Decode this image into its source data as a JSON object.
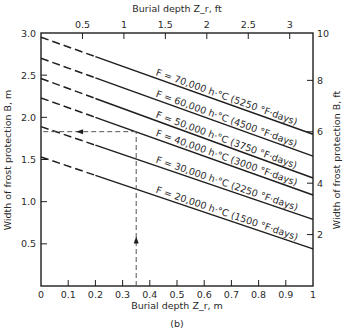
{
  "chart_data": {
    "type": "line",
    "caption": "(b)",
    "xlabel": "Burial depth Z_r, m",
    "x2label": "Burial depth Z_r, ft",
    "ylabel": "Width of frost protection B, m",
    "y2label": "Width of frost protection B, ft",
    "xlim": [
      0,
      1
    ],
    "ylim": [
      0,
      3.0
    ],
    "grid": false,
    "x_ticks": [
      "0",
      "0.1",
      "0.2",
      "0.3",
      "0.4",
      "0.5",
      "0.6",
      "0.7",
      "0.8",
      "0.9",
      "1"
    ],
    "x2_ticks": [
      "0.5",
      "1",
      "1.5",
      "2",
      "2.5",
      "3"
    ],
    "y_ticks": [
      "0.5",
      "1.0",
      "1.5",
      "2.0",
      "2.5",
      "3.0"
    ],
    "y2_ticks": [
      "2",
      "4",
      "6",
      "8",
      "10"
    ],
    "dashed_until_x": 0.2,
    "series": [
      {
        "name": "F = 70,000 h·°C (5250 °F·days)",
        "label_main": "F = 70,000 h·°C",
        "label_alt": "(5250 °F·days)",
        "x": [
          0,
          1
        ],
        "values": [
          2.95,
          1.8
        ]
      },
      {
        "name": "F = 60,000 h·°C (4500 °F·days)",
        "label_main": "F = 60,000 h·°C",
        "label_alt": "(4500 °F·days)",
        "x": [
          0,
          1
        ],
        "values": [
          2.7,
          1.54
        ]
      },
      {
        "name": "F = 50,000 h·°C (3750 °F·days)",
        "label_main": "F = 50,000 h·°C",
        "label_alt": "(3750 °F·days)",
        "x": [
          0,
          1
        ],
        "values": [
          2.46,
          1.28
        ]
      },
      {
        "name": "F = 40,000 h·°C (3000 °F·days)",
        "label_main": "F = 40,000 h·°C",
        "label_alt": "(3000 °F·days)",
        "x": [
          0,
          1
        ],
        "values": [
          2.23,
          1.08
        ]
      },
      {
        "name": "F = 30,000 h·°C (2250 °F·days)",
        "label_main": "F = 30,000 h·°C",
        "label_alt": "(2250 °F·days)",
        "x": [
          0,
          1
        ],
        "values": [
          1.89,
          0.79
        ]
      },
      {
        "name": "F = 20,000 h·°C (1500 °F·days)",
        "label_main": "F = 20,000 h·°C",
        "label_alt": "(1500 °F·days)",
        "x": [
          0,
          1
        ],
        "values": [
          1.53,
          0.44
        ]
      }
    ],
    "annotation": {
      "description": "Example reading: dashed guide from Z_r = 0.35 m up to F = 40,000 line, then left to B ≈ 1.83 m",
      "x": 0.35,
      "y": 1.83
    }
  }
}
